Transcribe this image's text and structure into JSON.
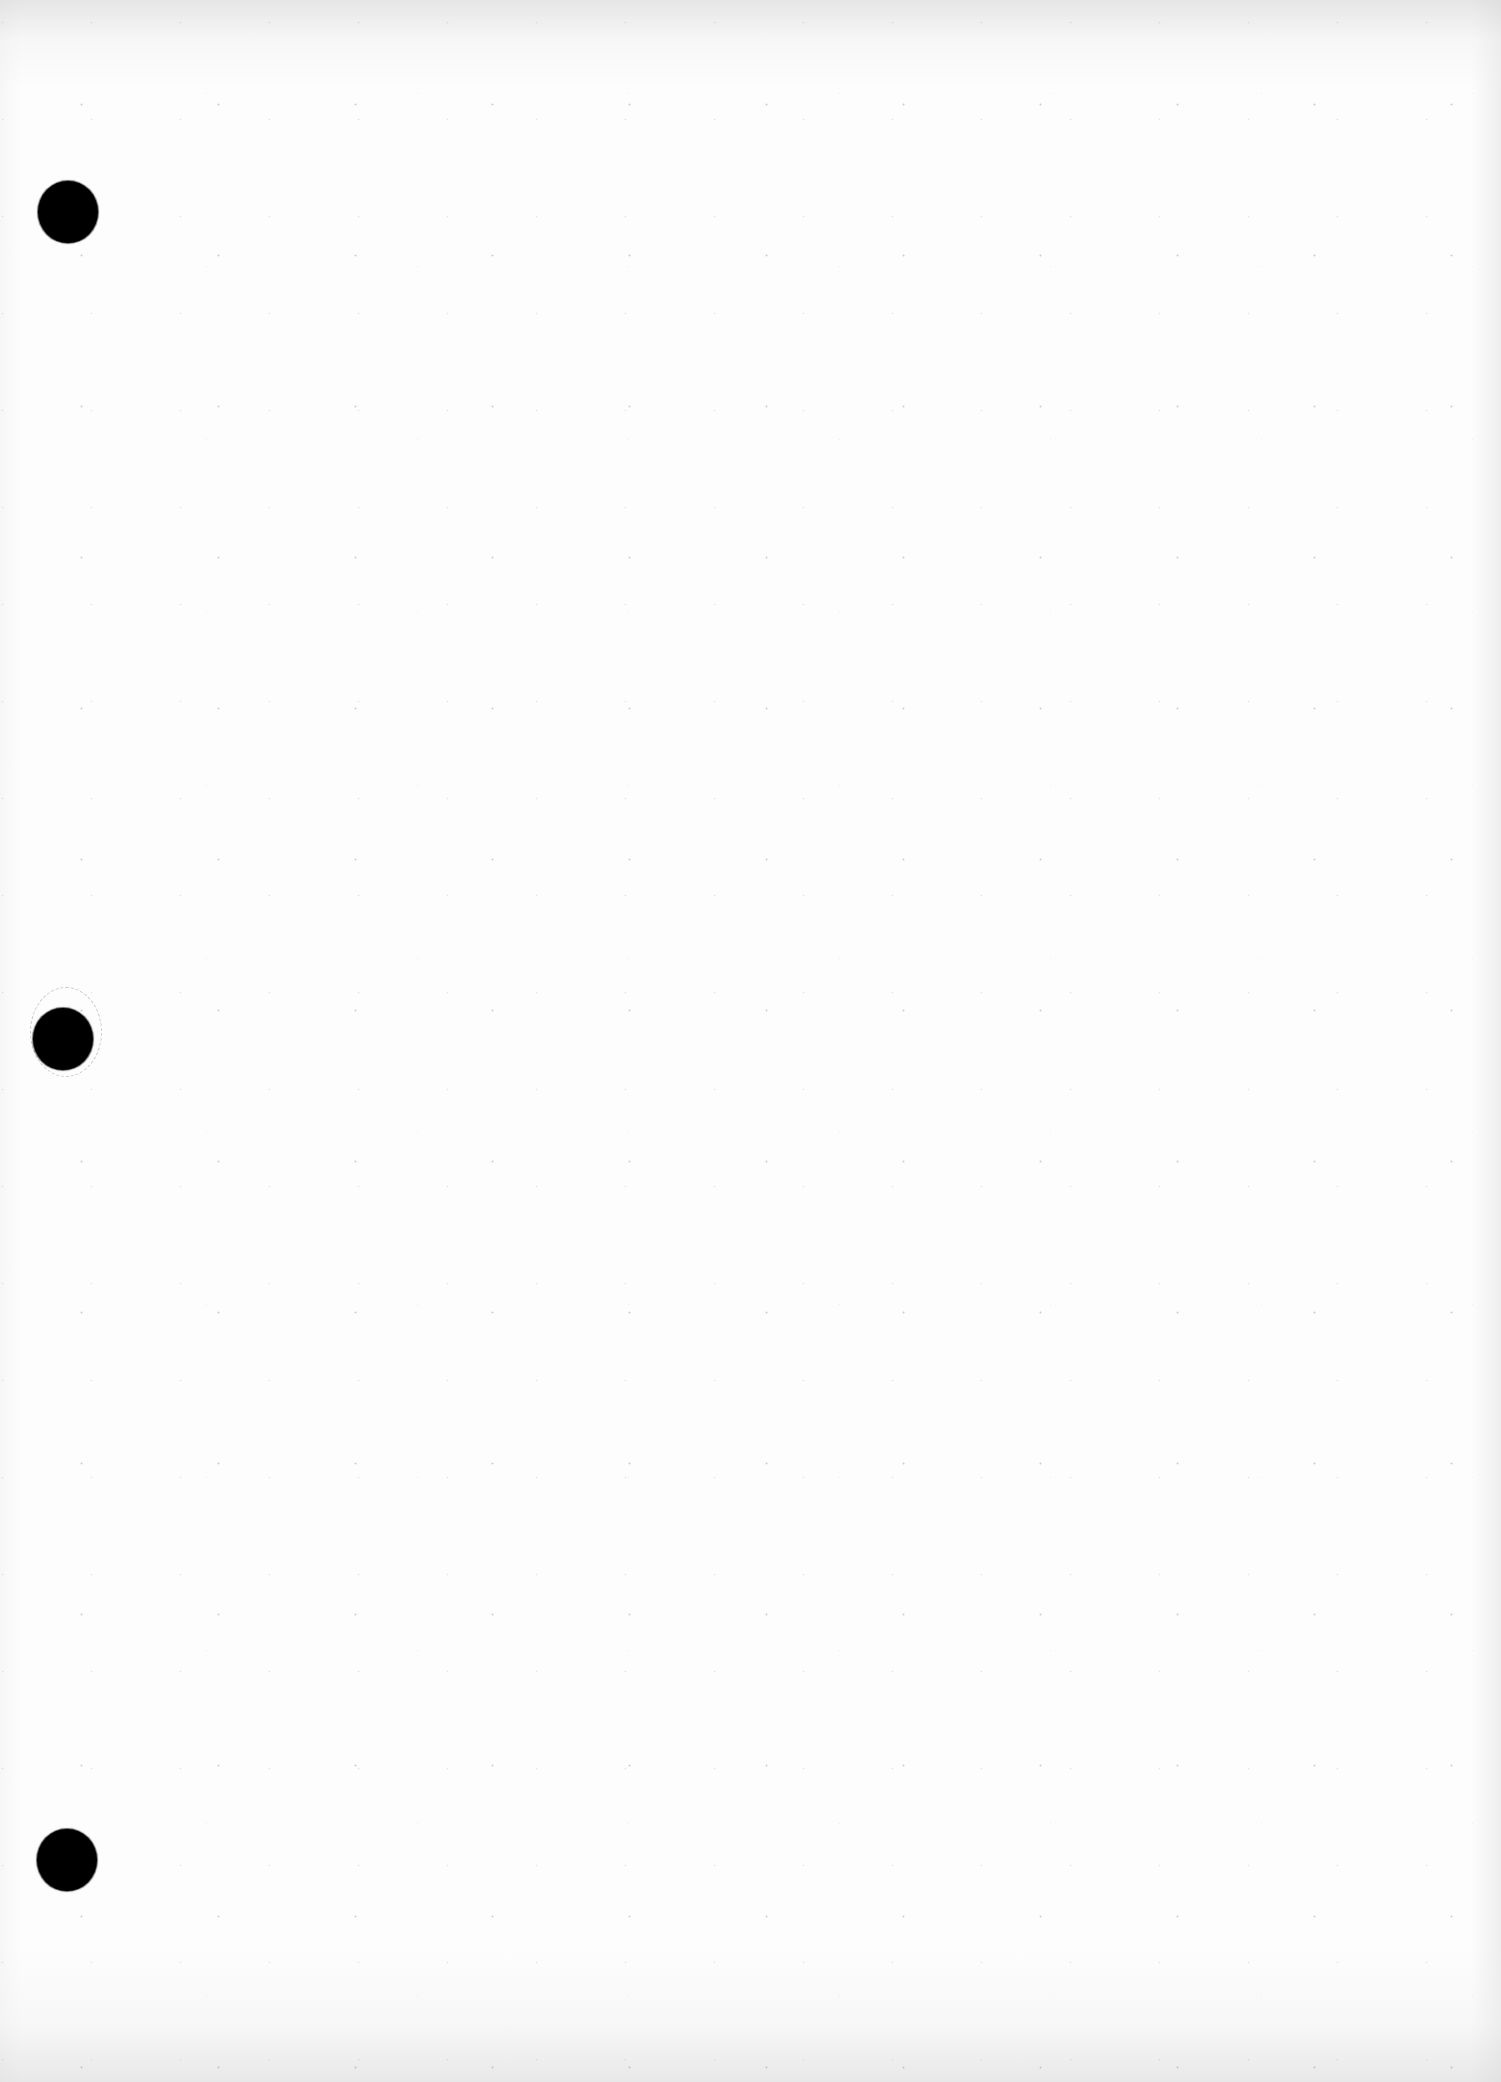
{
  "document": {
    "type": "blank scanned sheet",
    "background_color": "#ffffff",
    "text_content": "",
    "punch_holes": [
      {
        "id": 1,
        "color": "#000000"
      },
      {
        "id": 2,
        "color": "#000000"
      },
      {
        "id": 3,
        "color": "#000000"
      }
    ]
  }
}
